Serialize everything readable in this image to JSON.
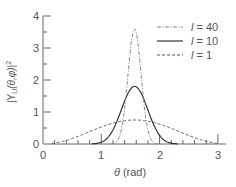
{
  "chart_data": {
    "type": "line",
    "title": "",
    "xlabel": "θ (rad)",
    "ylabel": "|Y_l,l(θ,φ)|²",
    "xlim": [
      0,
      3.1
    ],
    "ylim": [
      0,
      4
    ],
    "xticks": [
      0,
      1,
      2,
      3
    ],
    "yticks": [
      0,
      1,
      2,
      3,
      4
    ],
    "grid": false,
    "legend_position": "upper right",
    "series": [
      {
        "name": "l = 40",
        "style": "dash-dot",
        "peak": 3.6,
        "power": 80,
        "x": [
          1.2,
          1.3,
          1.4,
          1.5,
          1.571,
          1.64,
          1.74,
          1.84,
          1.94
        ],
        "values": [
          0.01,
          0.17,
          1.14,
          2.93,
          3.6,
          2.97,
          1.16,
          0.18,
          0.01
        ]
      },
      {
        "name": "l = 10",
        "style": "solid",
        "peak": 1.8,
        "power": 20,
        "x": [
          0.9,
          1.0,
          1.1,
          1.2,
          1.3,
          1.4,
          1.5,
          1.571,
          1.64,
          1.74,
          1.84,
          1.94,
          2.04,
          2.14,
          2.24
        ],
        "values": [
          0.01,
          0.06,
          0.17,
          0.41,
          0.82,
          1.3,
          1.71,
          1.8,
          1.72,
          1.33,
          0.85,
          0.43,
          0.18,
          0.06,
          0.02
        ]
      },
      {
        "name": "l = 1",
        "style": "dashed",
        "peak": 0.75,
        "power": 2,
        "x": [
          0.2,
          0.5,
          0.8,
          1.0,
          1.2,
          1.4,
          1.571,
          1.8,
          2.0,
          2.3,
          2.6,
          2.9,
          3.0
        ],
        "values": [
          0.03,
          0.17,
          0.39,
          0.53,
          0.65,
          0.73,
          0.75,
          0.71,
          0.62,
          0.4,
          0.2,
          0.04,
          0.01
        ]
      }
    ]
  },
  "axes": {
    "x_tick_labels": [
      "0",
      "1",
      "2",
      "3"
    ],
    "y_tick_labels": [
      "0",
      "1",
      "2",
      "3",
      "4"
    ],
    "xlabel_theta": "θ",
    "xlabel_unit": " (rad)",
    "ylabel_text": "|Y",
    "ylabel_sub": "l,l",
    "ylabel_args": "(θ,φ)|",
    "ylabel_sup": "2"
  },
  "legend": {
    "items": [
      {
        "var": "l",
        "eq": " = 40"
      },
      {
        "var": "l",
        "eq": " = 10"
      },
      {
        "var": "l",
        "eq": " = 1"
      }
    ]
  },
  "colors": {
    "axis": "#666666",
    "l40": "#8a8a8a",
    "l10": "#333333",
    "l1": "#555555",
    "text": "#555555"
  }
}
